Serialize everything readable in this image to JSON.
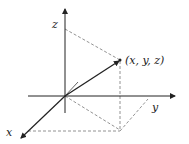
{
  "diagram": {
    "title": "",
    "labels": {
      "z_axis": "z",
      "y_axis": "y",
      "x_axis": "x",
      "point": "(x, y, z)"
    },
    "colors": {
      "axis": "#222222",
      "dashed": "#777777",
      "background": "#ffffff"
    }
  }
}
